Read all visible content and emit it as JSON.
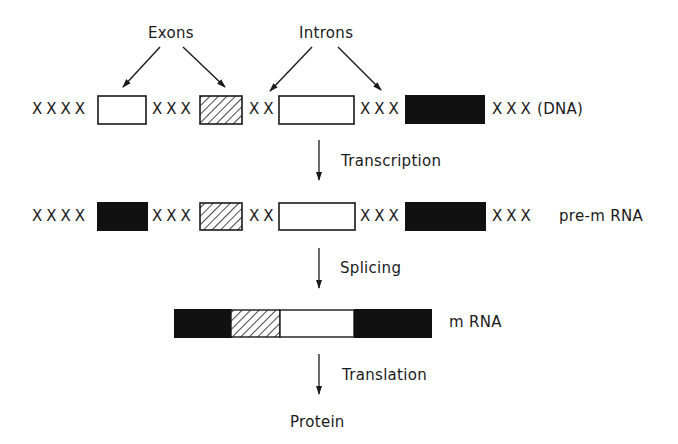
{
  "annotations": {
    "exons": "Exons",
    "introns": "Introns"
  },
  "dna": {
    "spacers": [
      "XXXX",
      "XXX",
      "XX",
      "XXX",
      "XXX"
    ],
    "label": "(DNA)"
  },
  "steps": {
    "transcription": "Transcription",
    "splicing": "Splicing",
    "translation": "Translation"
  },
  "pre_mrna": {
    "spacers": [
      "XXXX",
      "XXX",
      "XX",
      "XXX",
      "XXX"
    ],
    "label": "pre-m RNA"
  },
  "mrna": {
    "label": "m RNA"
  },
  "protein": {
    "label": "Protein"
  },
  "colors": {
    "ink": "#1a1a1a",
    "background": "#ffffff"
  }
}
